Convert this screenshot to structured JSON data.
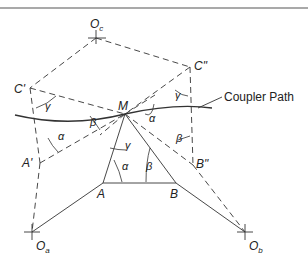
{
  "diagram": {
    "points": {
      "Oc": {
        "label": "O",
        "sub": "c"
      },
      "Ca": {
        "label": "C'"
      },
      "Cb": {
        "label": "C\""
      },
      "M": {
        "label": "M"
      },
      "Aa": {
        "label": "A'"
      },
      "A": {
        "label": "A"
      },
      "B": {
        "label": "B"
      },
      "Bb": {
        "label": "B\""
      },
      "Oa": {
        "label": "O",
        "sub": "a"
      },
      "Ob": {
        "label": "O",
        "sub": "b"
      }
    },
    "angles": {
      "alpha": "α",
      "beta": "β",
      "gamma": "γ"
    },
    "coupler_path_label": "Coupler Path",
    "colors": {
      "line": "#333333",
      "border": "#555555"
    }
  }
}
